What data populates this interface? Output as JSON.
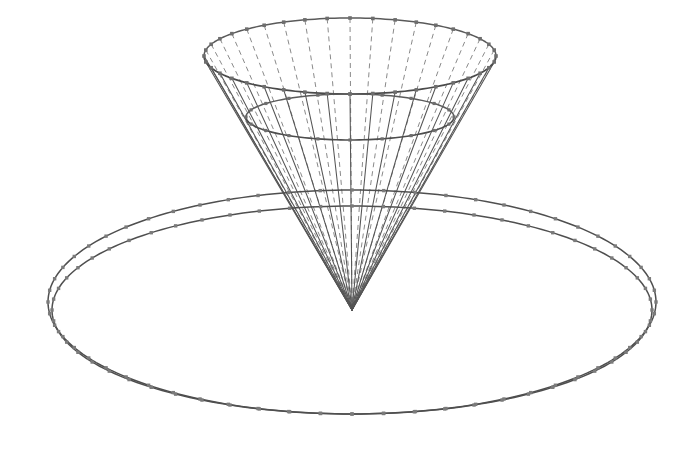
{
  "figure": {
    "background_color": "#ffffff",
    "width": 697,
    "height": 457,
    "line_color": "#555555",
    "hidden_line_color": "#8a8a8a",
    "vertex_color": "#6e6e6e",
    "rim_color": "#4a4a4a"
  },
  "chart_data": {
    "type": "scatter",
    "xlabel": "",
    "ylabel": "",
    "projection": "oblique-3d-wireframe",
    "grid": false,
    "legend": false,
    "objects": [
      {
        "name": "cone",
        "apex": [
          352,
          310
        ],
        "rim_center": [
          350,
          56
        ],
        "rim_radius_x": 146,
        "rim_radius_y": 38,
        "spokes": 40,
        "surface": "ruled-lines"
      },
      {
        "name": "cone-mid-circle",
        "center": [
          350,
          117
        ],
        "radius_x": 104,
        "radius_y": 23
      },
      {
        "name": "ring-outer-ellipse",
        "center": [
          352,
          302
        ],
        "radius_x": 304,
        "radius_y": 112,
        "vertices": 60
      },
      {
        "name": "ring-inner-ellipse",
        "center": [
          352,
          310
        ],
        "radius_x": 300,
        "radius_y": 104,
        "vertices": 60
      }
    ]
  },
  "labels": {
    "none_visible": ""
  }
}
